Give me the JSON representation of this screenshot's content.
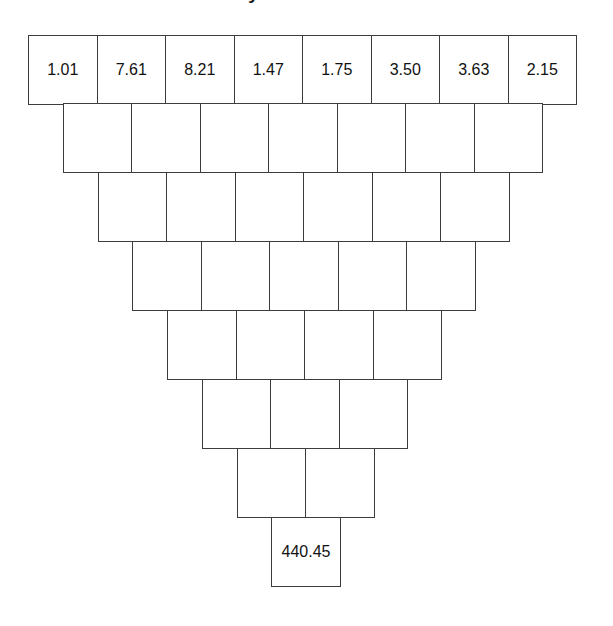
{
  "figure": {
    "title": "Pyramid Puzzle",
    "type": "number-pyramid-diagram",
    "orientation": "inverted",
    "border_color": "#3c3c3c",
    "background_color": "#ffffff",
    "text_color": "#111111"
  },
  "chart_data": {
    "type": "table",
    "title": "Pyramid Puzzle",
    "xlabel": "",
    "ylabel": "",
    "grid": true,
    "legend": null,
    "rows": [
      {
        "row": 1,
        "cell_count": 8,
        "values": [
          "1.01",
          "7.61",
          "8.21",
          "1.47",
          "1.75",
          "3.50",
          "3.63",
          "2.15"
        ]
      },
      {
        "row": 2,
        "cell_count": 7,
        "values": [
          "",
          "",
          "",
          "",
          "",
          "",
          ""
        ]
      },
      {
        "row": 3,
        "cell_count": 6,
        "values": [
          "",
          "",
          "",
          "",
          "",
          ""
        ]
      },
      {
        "row": 4,
        "cell_count": 5,
        "values": [
          "",
          "",
          "",
          "",
          ""
        ]
      },
      {
        "row": 5,
        "cell_count": 4,
        "values": [
          "",
          "",
          "",
          ""
        ]
      },
      {
        "row": 6,
        "cell_count": 3,
        "values": [
          "",
          "",
          ""
        ]
      },
      {
        "row": 7,
        "cell_count": 2,
        "values": [
          "",
          ""
        ]
      },
      {
        "row": 8,
        "cell_count": 1,
        "values": [
          "440.45"
        ]
      }
    ]
  },
  "layout": {
    "cell_width": 69.5,
    "cell_height": 70,
    "origin_x": 28,
    "origin_y": 35,
    "row_indent": 34.75
  }
}
